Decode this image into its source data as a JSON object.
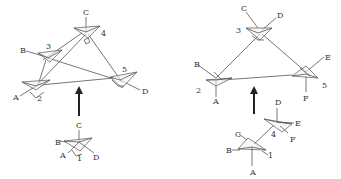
{
  "figure": {
    "left_panel": {
      "description": "Tetrahedral center 1 with substituents A,B,C,D replaced by tetrahedra 2-5, forming a triangular/tetrahedral framework",
      "polyhedra_labels": [
        "1",
        "2",
        "3",
        "4",
        "5"
      ],
      "substituent_labels": [
        "A",
        "B",
        "C",
        "D"
      ],
      "top": {
        "labels": {
          "C": "C",
          "B": "B",
          "A": "A",
          "D": "D",
          "n2": "2",
          "n3": "3",
          "n4": "4",
          "n5": "5"
        }
      },
      "bottom": {
        "labels": {
          "C": "C",
          "B": "B",
          "A": "A",
          "D": "D",
          "n1": "1"
        }
      }
    },
    "right_panel": {
      "description": "Two linked tetrahedra 1 and 4 with substituents A-F expanded into a triangular framework of tetrahedra 2,3,5",
      "polyhedra_labels": [
        "1",
        "2",
        "3",
        "4",
        "5"
      ],
      "substituent_labels": [
        "A",
        "B",
        "C",
        "D",
        "E",
        "F"
      ],
      "top": {
        "labels": {
          "C": "C",
          "D": "D",
          "B": "B",
          "A": "A",
          "E": "E",
          "F": "F",
          "n2": "2",
          "n3": "3",
          "n5": "5"
        }
      },
      "bottom": {
        "labels": {
          "D": "D",
          "E": "E",
          "F": "F",
          "C": "C",
          "B": "B",
          "A": "A",
          "n1": "1",
          "n4": "4"
        }
      }
    },
    "arrows": [
      "up",
      "up"
    ]
  }
}
